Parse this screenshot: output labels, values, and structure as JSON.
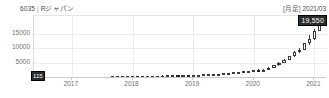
{
  "header": {
    "code": "6035",
    "separator": "|",
    "name": "Rジャパン",
    "frequency": "[月足]",
    "date": "2021/03"
  },
  "price_tag": {
    "value": "19,550"
  },
  "start_label": {
    "value": "115"
  },
  "colors": {
    "up_body": "#ffffff",
    "down_body": "#262626",
    "outline": "#3a3a3a",
    "grid": "#ececec",
    "axis": "#c9c9c9",
    "text": "#6e6e6e",
    "tag_bg": "#2b2b2b",
    "tag_fg": "#ffffff"
  },
  "chart_data": {
    "type": "candlestick",
    "subtitle": "[月足] 2021/03",
    "xlabel": "",
    "ylabel": "",
    "ylim": [
      0,
      21000
    ],
    "yticks": [
      5000,
      10000,
      15000
    ],
    "ytick_labels": [
      "5000",
      "10000",
      "15000"
    ],
    "xticks": [
      "2017",
      "2018",
      "2019",
      "2020",
      "2021"
    ],
    "grid": true,
    "legend": null,
    "last_close": 19550,
    "currency": "JPY",
    "series_name": "6035 Rジャパン 月足",
    "candles": [
      {
        "t": "2016-06",
        "o": 120,
        "h": 150,
        "l": 110,
        "c": 115
      },
      {
        "t": "2016-07",
        "o": 115,
        "h": 180,
        "l": 110,
        "c": 170
      },
      {
        "t": "2016-08",
        "o": 170,
        "h": 210,
        "l": 160,
        "c": 200
      },
      {
        "t": "2016-09",
        "o": 200,
        "h": 240,
        "l": 190,
        "c": 230
      },
      {
        "t": "2016-10",
        "o": 230,
        "h": 260,
        "l": 215,
        "c": 245
      },
      {
        "t": "2016-11",
        "o": 245,
        "h": 300,
        "l": 240,
        "c": 290
      },
      {
        "t": "2016-12",
        "o": 290,
        "h": 330,
        "l": 275,
        "c": 320
      },
      {
        "t": "2017-01",
        "o": 320,
        "h": 350,
        "l": 300,
        "c": 330
      },
      {
        "t": "2017-02",
        "o": 330,
        "h": 360,
        "l": 315,
        "c": 345
      },
      {
        "t": "2017-03",
        "o": 345,
        "h": 380,
        "l": 335,
        "c": 370
      },
      {
        "t": "2017-04",
        "o": 370,
        "h": 400,
        "l": 355,
        "c": 385
      },
      {
        "t": "2017-05",
        "o": 385,
        "h": 430,
        "l": 375,
        "c": 420
      },
      {
        "t": "2017-06",
        "o": 420,
        "h": 460,
        "l": 405,
        "c": 445
      },
      {
        "t": "2017-07",
        "o": 445,
        "h": 470,
        "l": 425,
        "c": 450
      },
      {
        "t": "2017-08",
        "o": 450,
        "h": 490,
        "l": 440,
        "c": 480
      },
      {
        "t": "2017-09",
        "o": 480,
        "h": 520,
        "l": 470,
        "c": 510
      },
      {
        "t": "2017-10",
        "o": 510,
        "h": 560,
        "l": 500,
        "c": 550
      },
      {
        "t": "2017-11",
        "o": 550,
        "h": 600,
        "l": 535,
        "c": 585
      },
      {
        "t": "2017-12",
        "o": 585,
        "h": 620,
        "l": 570,
        "c": 600
      },
      {
        "t": "2018-01",
        "o": 600,
        "h": 660,
        "l": 590,
        "c": 650
      },
      {
        "t": "2018-02",
        "o": 650,
        "h": 680,
        "l": 620,
        "c": 640
      },
      {
        "t": "2018-03",
        "o": 640,
        "h": 700,
        "l": 630,
        "c": 690
      },
      {
        "t": "2018-04",
        "o": 690,
        "h": 740,
        "l": 675,
        "c": 730
      },
      {
        "t": "2018-05",
        "o": 730,
        "h": 780,
        "l": 715,
        "c": 765
      },
      {
        "t": "2018-06",
        "o": 765,
        "h": 820,
        "l": 750,
        "c": 805
      },
      {
        "t": "2018-07",
        "o": 805,
        "h": 860,
        "l": 790,
        "c": 845
      },
      {
        "t": "2018-08",
        "o": 845,
        "h": 900,
        "l": 830,
        "c": 880
      },
      {
        "t": "2018-09",
        "o": 880,
        "h": 960,
        "l": 870,
        "c": 950
      },
      {
        "t": "2018-10",
        "o": 950,
        "h": 990,
        "l": 900,
        "c": 930
      },
      {
        "t": "2018-11",
        "o": 930,
        "h": 1010,
        "l": 915,
        "c": 1000
      },
      {
        "t": "2018-12",
        "o": 1000,
        "h": 1050,
        "l": 950,
        "c": 980
      },
      {
        "t": "2019-01",
        "o": 980,
        "h": 1100,
        "l": 970,
        "c": 1080
      },
      {
        "t": "2019-02",
        "o": 1080,
        "h": 1180,
        "l": 1060,
        "c": 1160
      },
      {
        "t": "2019-03",
        "o": 1160,
        "h": 1250,
        "l": 1140,
        "c": 1230
      },
      {
        "t": "2019-04",
        "o": 1230,
        "h": 1320,
        "l": 1210,
        "c": 1300
      },
      {
        "t": "2019-05",
        "o": 1300,
        "h": 1400,
        "l": 1280,
        "c": 1380
      },
      {
        "t": "2019-06",
        "o": 1380,
        "h": 1500,
        "l": 1360,
        "c": 1470
      },
      {
        "t": "2019-07",
        "o": 1470,
        "h": 1620,
        "l": 1450,
        "c": 1600
      },
      {
        "t": "2019-08",
        "o": 1600,
        "h": 1720,
        "l": 1550,
        "c": 1680
      },
      {
        "t": "2019-09",
        "o": 1680,
        "h": 1900,
        "l": 1660,
        "c": 1870
      },
      {
        "t": "2019-10",
        "o": 1870,
        "h": 2100,
        "l": 1840,
        "c": 2060
      },
      {
        "t": "2019-11",
        "o": 2060,
        "h": 2300,
        "l": 2020,
        "c": 2260
      },
      {
        "t": "2019-12",
        "o": 2260,
        "h": 2500,
        "l": 2200,
        "c": 2420
      },
      {
        "t": "2020-01",
        "o": 2420,
        "h": 2750,
        "l": 2380,
        "c": 2700
      },
      {
        "t": "2020-02",
        "o": 2700,
        "h": 2900,
        "l": 2400,
        "c": 2600
      },
      {
        "t": "2020-03",
        "o": 2600,
        "h": 3000,
        "l": 2200,
        "c": 2850
      },
      {
        "t": "2020-04",
        "o": 2850,
        "h": 3600,
        "l": 2800,
        "c": 3500
      },
      {
        "t": "2020-05",
        "o": 3500,
        "h": 4400,
        "l": 3450,
        "c": 4300
      },
      {
        "t": "2020-06",
        "o": 4300,
        "h": 5400,
        "l": 4200,
        "c": 5200
      },
      {
        "t": "2020-07",
        "o": 5200,
        "h": 6400,
        "l": 5100,
        "c": 6200
      },
      {
        "t": "2020-08",
        "o": 6200,
        "h": 7600,
        "l": 6000,
        "c": 7400
      },
      {
        "t": "2020-09",
        "o": 7400,
        "h": 9000,
        "l": 7200,
        "c": 8700
      },
      {
        "t": "2020-10",
        "o": 8700,
        "h": 10200,
        "l": 8300,
        "c": 9600
      },
      {
        "t": "2020-11",
        "o": 9600,
        "h": 12000,
        "l": 9400,
        "c": 11700
      },
      {
        "t": "2020-12",
        "o": 11700,
        "h": 14500,
        "l": 11200,
        "c": 13200
      },
      {
        "t": "2021-01",
        "o": 13200,
        "h": 16500,
        "l": 12800,
        "c": 16000
      },
      {
        "t": "2021-02",
        "o": 16000,
        "h": 20800,
        "l": 15800,
        "c": 20400
      },
      {
        "t": "2021-03",
        "o": 20400,
        "h": 20900,
        "l": 18900,
        "c": 19550
      }
    ]
  }
}
